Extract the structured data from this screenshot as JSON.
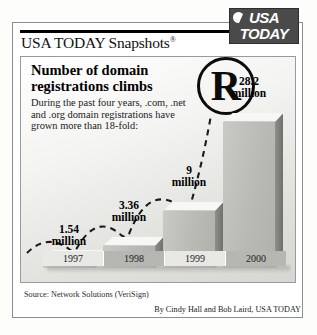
{
  "masthead": {
    "title": "USA TODAY Snapshots",
    "registered_symbol": "®",
    "logo_line1": "USA",
    "logo_line2": "TODAY"
  },
  "panel": {
    "headline": "Number of domain registrations climbs",
    "description": "During the past four years, .com, .net and .org domain registrations have grown more than 18-fold:",
    "watermark_letter": "R"
  },
  "footer": {
    "source": "Source: Network Solutions (VeriSign)",
    "credit": "By Cindy Hall and Bob Laird, USA TODAY"
  },
  "colors": {
    "bar_front": "#b9b9b5",
    "bar_top": "#f7f7f5",
    "bar_side": "#7e7e7a",
    "logo_box": "#4a4a4a",
    "rule": "#000000"
  },
  "chart_data": {
    "type": "bar",
    "title": "Number of domain registrations climbs",
    "subtitle": "During the past four years, .com, .net and .org domain registrations have grown more than 18-fold:",
    "xlabel": "",
    "ylabel": "Domain registrations (millions)",
    "categories": [
      "1997",
      "1998",
      "1999",
      "2000"
    ],
    "values": [
      1.54,
      3.36,
      9,
      28.2
    ],
    "value_labels": [
      "1.54 million",
      "3.36 million",
      "9 million",
      "28.2 million"
    ],
    "value_label_lines": [
      [
        "1.54",
        "million"
      ],
      [
        "3.36",
        "million"
      ],
      [
        "9",
        "million"
      ],
      [
        "28.2",
        "million"
      ]
    ],
    "units": "millions",
    "ylim": [
      0,
      28.2
    ],
    "grid": false,
    "legend": "none",
    "annotations": [
      "dashed rising trend arc across the columns"
    ],
    "source": "Network Solutions (VeriSign)"
  },
  "bars": [
    {
      "year": "1997",
      "value": 1.54,
      "left": 22,
      "width": 52,
      "height": 9,
      "label_left": 18,
      "label_top": 166
    },
    {
      "year": "1998",
      "value": 3.36,
      "left": 82,
      "width": 52,
      "height": 22,
      "label_left": 78,
      "label_top": 142
    },
    {
      "year": "1999",
      "value": 9,
      "left": 142,
      "width": 52,
      "height": 57,
      "label_left": 138,
      "label_top": 107
    },
    {
      "year": "2000",
      "value": 28.2,
      "left": 202,
      "width": 52,
      "height": 146,
      "label_left": 198,
      "label_top": 18
    }
  ]
}
